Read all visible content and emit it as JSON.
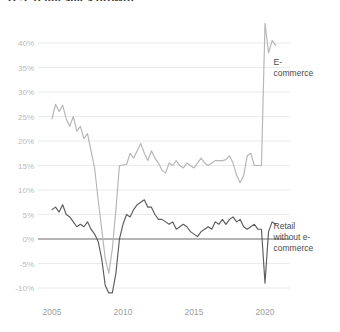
{
  "title": "U.S. retail sales growth",
  "chart_data": {
    "type": "line",
    "title": "U.S. retail sales growth",
    "xlabel": "",
    "ylabel": "",
    "xlim": [
      2005.0,
      2021.0
    ],
    "ylim": [
      -12,
      45
    ],
    "grid": true,
    "legend_position": "right-inline-annotations",
    "y_ticks": [
      "40%",
      "35%",
      "30%",
      "25%",
      "20%",
      "15%",
      "10%",
      "5%",
      "0%",
      "-5%",
      "-10%"
    ],
    "y_tick_values": [
      40,
      35,
      30,
      25,
      20,
      15,
      10,
      5,
      0,
      -5,
      -10
    ],
    "x_ticks": [
      "2005",
      "2010",
      "2015",
      "2020"
    ],
    "x_tick_values": [
      2005,
      2010,
      2015,
      2020
    ],
    "annotations": [
      {
        "name": "e-commerce-label",
        "lines": [
          "E-",
          "commerce"
        ],
        "x": 2020.6,
        "y": 35.5
      },
      {
        "name": "retail-label",
        "lines": [
          "Retail",
          "without e-",
          "commerce"
        ],
        "x": 2020.6,
        "y": 2.0
      }
    ],
    "series": [
      {
        "name": "E-commerce",
        "color": "#b5b5b5",
        "x": [
          2005.0,
          2005.25,
          2005.5,
          2005.75,
          2006.0,
          2006.25,
          2006.5,
          2006.75,
          2007.0,
          2007.25,
          2007.5,
          2007.75,
          2008.0,
          2008.25,
          2008.5,
          2008.75,
          2009.0,
          2009.25,
          2009.5,
          2009.75,
          2010.0,
          2010.25,
          2010.5,
          2010.75,
          2011.0,
          2011.25,
          2011.5,
          2011.75,
          2012.0,
          2012.25,
          2012.5,
          2012.75,
          2013.0,
          2013.25,
          2013.5,
          2013.75,
          2014.0,
          2014.25,
          2014.5,
          2014.75,
          2015.0,
          2015.25,
          2015.5,
          2015.75,
          2016.0,
          2016.25,
          2016.5,
          2016.75,
          2017.0,
          2017.25,
          2017.5,
          2017.75,
          2018.0,
          2018.25,
          2018.5,
          2018.75,
          2019.0,
          2019.25,
          2019.5,
          2019.75,
          2020.0,
          2020.25,
          2020.5,
          2020.75
        ],
        "y": [
          24.5,
          27.5,
          26.0,
          27.3,
          24.5,
          23.0,
          25.0,
          22.0,
          23.0,
          20.5,
          21.5,
          18.0,
          14.5,
          8.0,
          2.0,
          -4.0,
          -7.0,
          -2.0,
          6.0,
          15.0,
          15.1,
          15.2,
          17.5,
          16.5,
          18.0,
          19.5,
          17.5,
          16.0,
          18.0,
          16.5,
          15.5,
          14.0,
          13.5,
          15.5,
          15.0,
          16.0,
          15.0,
          14.5,
          15.5,
          15.0,
          14.5,
          15.5,
          16.5,
          15.5,
          15.0,
          15.5,
          16.0,
          16.0,
          16.0,
          16.2,
          17.0,
          15.5,
          13.0,
          11.5,
          13.0,
          17.0,
          17.5,
          15.0,
          15.0,
          15.0,
          44.0,
          38.0,
          40.5,
          39.5
        ]
      },
      {
        "name": "Retail without e-commerce",
        "color": "#5c5c5c",
        "x": [
          2005.0,
          2005.25,
          2005.5,
          2005.75,
          2006.0,
          2006.25,
          2006.5,
          2006.75,
          2007.0,
          2007.25,
          2007.5,
          2007.75,
          2008.0,
          2008.25,
          2008.5,
          2008.75,
          2009.0,
          2009.25,
          2009.5,
          2009.75,
          2010.0,
          2010.25,
          2010.5,
          2010.75,
          2011.0,
          2011.25,
          2011.5,
          2011.75,
          2012.0,
          2012.25,
          2012.5,
          2012.75,
          2013.0,
          2013.25,
          2013.5,
          2013.75,
          2014.0,
          2014.25,
          2014.5,
          2014.75,
          2015.0,
          2015.25,
          2015.5,
          2015.75,
          2016.0,
          2016.25,
          2016.5,
          2016.75,
          2017.0,
          2017.25,
          2017.5,
          2017.75,
          2018.0,
          2018.25,
          2018.5,
          2018.75,
          2019.0,
          2019.25,
          2019.5,
          2019.75,
          2020.0,
          2020.25,
          2020.5,
          2020.75
        ],
        "y": [
          6.0,
          6.5,
          5.5,
          7.0,
          5.0,
          4.5,
          3.5,
          2.5,
          3.0,
          2.5,
          3.5,
          2.0,
          1.0,
          -0.5,
          -4.0,
          -9.5,
          -11.0,
          -11.0,
          -7.0,
          0.0,
          3.0,
          5.0,
          4.5,
          6.0,
          7.0,
          7.5,
          8.0,
          6.5,
          6.5,
          5.0,
          4.0,
          4.0,
          3.5,
          3.0,
          3.5,
          2.0,
          2.5,
          3.0,
          2.5,
          1.5,
          1.0,
          0.5,
          1.5,
          2.0,
          2.5,
          2.0,
          3.5,
          3.0,
          4.0,
          3.0,
          4.0,
          4.5,
          3.5,
          4.0,
          2.5,
          2.0,
          2.5,
          3.0,
          2.0,
          2.0,
          -9.0,
          1.5,
          3.5,
          3.0
        ]
      }
    ]
  }
}
